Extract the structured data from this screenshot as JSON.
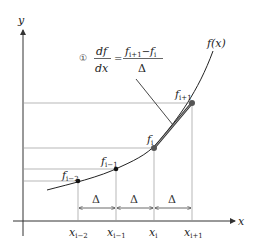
{
  "diagram": {
    "axes": {
      "x_label": "x",
      "y_label": "y"
    },
    "curve_label": "f(x)",
    "formula": {
      "marker": "①",
      "lhs_num": "df",
      "lhs_den": "dx",
      "equals": "=",
      "rhs_num_a": "f",
      "rhs_num_a_sub": "i+1",
      "rhs_num_minus": "−",
      "rhs_num_b": "f",
      "rhs_num_b_sub": "i",
      "rhs_den": "Δ"
    },
    "points": [
      {
        "label": "f",
        "sub": "i−2",
        "x_label": "x",
        "x_sub": "i−2"
      },
      {
        "label": "f",
        "sub": "i−1",
        "x_label": "x",
        "x_sub": "i−1"
      },
      {
        "label": "f",
        "sub": "i",
        "x_label": "x",
        "x_sub": "i"
      },
      {
        "label": "f",
        "sub": "i+1",
        "x_label": "x",
        "x_sub": "i+1"
      }
    ],
    "spacing_label": "Δ",
    "colors": {
      "line": "#333333",
      "guide": "#888888",
      "point": "#111111",
      "highlight_point": "#555555"
    }
  }
}
